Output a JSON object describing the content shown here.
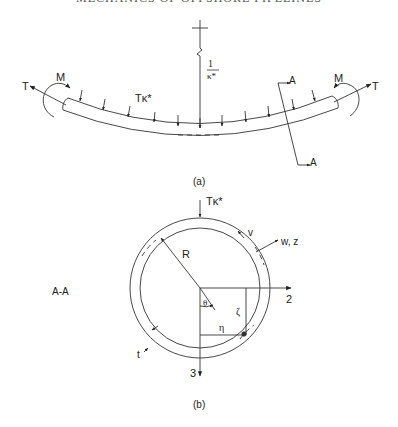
{
  "header": {
    "running_title": "MECHANICS OF OFFSHORE PIPELINES"
  },
  "figure_a": {
    "caption": "(a)",
    "labels": {
      "tension_left": "T",
      "tension_right": "T",
      "moment_left": "M",
      "moment_right": "M",
      "distributed_load": "Tκ*",
      "curvature_num": "1",
      "curvature_den": "κ*",
      "section_top": "A",
      "section_bottom": "A"
    }
  },
  "figure_b": {
    "caption": "(b)",
    "section_label": "A-A",
    "labels": {
      "load": "Tκ*",
      "radius": "R",
      "v": "v",
      "w_z": "w, z",
      "axis_2": "2",
      "axis_3": "3",
      "theta": "θ",
      "zeta": "ζ",
      "eta": "η",
      "thickness": "t"
    }
  }
}
